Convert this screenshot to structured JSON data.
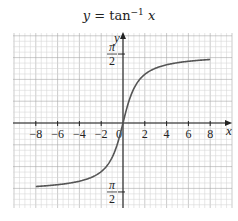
{
  "chart_data": {
    "type": "line",
    "title_parts": {
      "lhs": "y",
      "eq": " = tan",
      "exp": "−1",
      "arg": " x"
    },
    "xlabel": "x",
    "ylabel": "y",
    "xlim": [
      -10,
      10
    ],
    "ylim": [
      -1.9,
      2.0
    ],
    "grid": true,
    "x_ticks": [
      -8,
      -6,
      -4,
      -2,
      0,
      2,
      4,
      6,
      8
    ],
    "x_tick_labels": [
      "−8",
      "−6",
      "−4",
      "−2",
      "0",
      "2",
      "4",
      "6",
      "8"
    ],
    "y_ticks": [
      1.5708,
      -1.5708
    ],
    "y_tick_labels": [
      {
        "num": "π",
        "den": "2"
      },
      {
        "num": "π",
        "den": "2"
      }
    ],
    "series": [
      {
        "name": "y = tan^-1 x",
        "color": "#555555",
        "x": [
          -8,
          -6,
          -4,
          -3,
          -2,
          -1.5,
          -1,
          -0.5,
          0,
          0.5,
          1,
          1.5,
          2,
          3,
          4,
          6,
          8
        ],
        "y": [
          -1.446,
          -1.406,
          -1.326,
          -1.249,
          -1.107,
          -0.983,
          -0.785,
          -0.464,
          0,
          0.464,
          0.785,
          0.983,
          1.107,
          1.249,
          1.326,
          1.406,
          1.446
        ]
      }
    ]
  },
  "colors": {
    "grid_minor": "#d6d6d6",
    "grid_major": "#a8a8a8",
    "axis": "#222222",
    "curve": "#555555"
  }
}
